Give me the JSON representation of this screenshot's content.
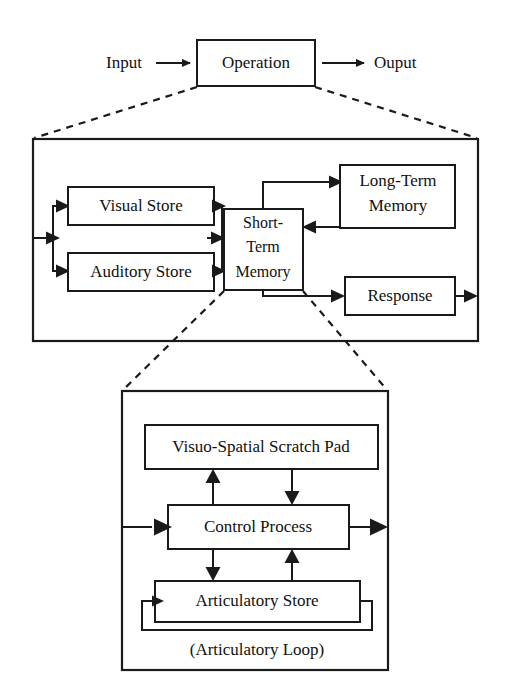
{
  "diagram": {
    "type": "block-diagram",
    "levels": [
      {
        "name": "top-level",
        "nodes": [
          {
            "id": "operation",
            "label": "Operation",
            "kind": "box"
          }
        ],
        "flow_labels": [
          {
            "id": "input",
            "label": "Input"
          },
          {
            "id": "output",
            "label": "Ouput"
          }
        ]
      },
      {
        "name": "middle-level",
        "container": "information-processing-container",
        "nodes": [
          {
            "id": "visual-store",
            "label": "Visual Store",
            "kind": "box"
          },
          {
            "id": "auditory-store",
            "label": "Auditory Store",
            "kind": "box"
          },
          {
            "id": "short-term-memory",
            "label": "Short-\nTerm\nMemory",
            "lines": [
              "Short-",
              "Term",
              "Memory"
            ],
            "kind": "box"
          },
          {
            "id": "long-term-memory",
            "label": "Long-Term\nMemory",
            "lines": [
              "Long-Term",
              "Memory"
            ],
            "kind": "box"
          },
          {
            "id": "response",
            "label": "Response",
            "kind": "box"
          }
        ]
      },
      {
        "name": "bottom-level",
        "container": "working-memory-container",
        "nodes": [
          {
            "id": "visuo-spatial-scratch-pad",
            "label": "Visuo-Spatial Scratch Pad",
            "kind": "box"
          },
          {
            "id": "control-process",
            "label": "Control Process",
            "kind": "box"
          },
          {
            "id": "articulatory-store",
            "label": "Articulatory Store",
            "kind": "box"
          }
        ],
        "caption": "(Articulatory Loop)"
      }
    ],
    "connections": [
      {
        "from": "input",
        "to": "operation",
        "style": "solid-arrow"
      },
      {
        "from": "operation",
        "to": "output",
        "style": "solid-arrow"
      },
      {
        "from": "operation",
        "to": "information-processing-container",
        "style": "dashed-expansion"
      },
      {
        "from": "container-left-edge",
        "to": "visual-store",
        "style": "solid-arrow"
      },
      {
        "from": "container-left-edge",
        "to": "auditory-store",
        "style": "solid-arrow"
      },
      {
        "from": "visual-store",
        "to": "short-term-memory",
        "style": "solid-arrow"
      },
      {
        "from": "auditory-store",
        "to": "short-term-memory",
        "style": "solid-arrow"
      },
      {
        "from": "short-term-memory",
        "to": "long-term-memory",
        "style": "solid-arrow"
      },
      {
        "from": "long-term-memory",
        "to": "short-term-memory",
        "style": "solid-arrow"
      },
      {
        "from": "short-term-memory",
        "to": "response",
        "style": "solid-arrow"
      },
      {
        "from": "response",
        "to": "container-right-edge",
        "style": "solid-arrow"
      },
      {
        "from": "short-term-memory",
        "to": "working-memory-container",
        "style": "dashed-expansion"
      },
      {
        "from": "container-left-edge",
        "to": "control-process",
        "style": "solid-arrow"
      },
      {
        "from": "control-process",
        "to": "visuo-spatial-scratch-pad",
        "style": "solid-arrow"
      },
      {
        "from": "visuo-spatial-scratch-pad",
        "to": "control-process",
        "style": "solid-arrow"
      },
      {
        "from": "control-process",
        "to": "articulatory-store",
        "style": "solid-arrow"
      },
      {
        "from": "articulatory-store",
        "to": "control-process",
        "style": "solid-arrow"
      },
      {
        "from": "articulatory-store",
        "to": "articulatory-store",
        "style": "solid-arrow-loop"
      },
      {
        "from": "control-process",
        "to": "container-right-edge",
        "style": "solid-arrow"
      }
    ],
    "colors": {
      "ink": "#1a1a1a",
      "background": "#ffffff",
      "text": "#111111"
    }
  }
}
